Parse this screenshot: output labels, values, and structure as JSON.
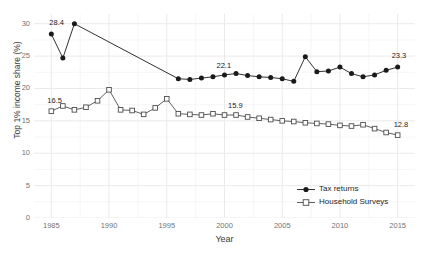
{
  "chart_data": {
    "type": "line",
    "title": "",
    "xlabel": "Year",
    "ylabel": "Top 1% income share (%)",
    "xlim": [
      1983.5,
      2016.5
    ],
    "ylim": [
      0,
      31.5
    ],
    "grid": true,
    "legend_position": "bottom-right",
    "y_ticks": [
      0,
      5,
      10,
      15,
      20,
      25,
      30
    ],
    "x_ticks": [
      1985,
      1990,
      1995,
      2000,
      2005,
      2010,
      2015
    ],
    "series": [
      {
        "name": "Tax returns",
        "marker": "filled-circle",
        "color": "#1a1a1a",
        "x": [
          1985,
          1986,
          1987,
          1996,
          1997,
          1998,
          1999,
          2000,
          2001,
          2002,
          2003,
          2004,
          2005,
          2006,
          2007,
          2008,
          2009,
          2010,
          2011,
          2012,
          2013,
          2014,
          2015
        ],
        "values": [
          28.4,
          24.7,
          30.0,
          21.5,
          21.4,
          21.6,
          21.8,
          22.1,
          22.3,
          22.0,
          21.8,
          21.7,
          21.5,
          21.1,
          24.9,
          22.6,
          22.7,
          23.3,
          22.3,
          21.8,
          22.1,
          22.8,
          23.3
        ]
      },
      {
        "name": "Household Surveys",
        "marker": "open-square",
        "color": "#4d4d4d",
        "x": [
          1985,
          1986,
          1987,
          1988,
          1989,
          1990,
          1991,
          1992,
          1993,
          1994,
          1995,
          1996,
          1997,
          1998,
          1999,
          2000,
          2001,
          2002,
          2003,
          2004,
          2005,
          2006,
          2007,
          2008,
          2009,
          2010,
          2011,
          2012,
          2013,
          2014,
          2015
        ],
        "values": [
          16.5,
          17.3,
          16.7,
          17.1,
          18.1,
          19.8,
          16.7,
          16.6,
          16.0,
          17.0,
          18.4,
          16.1,
          16.0,
          15.9,
          16.1,
          15.9,
          15.9,
          15.6,
          15.4,
          15.2,
          15.0,
          14.9,
          14.7,
          14.6,
          14.5,
          14.3,
          14.2,
          14.4,
          13.8,
          13.2,
          12.8
        ]
      }
    ],
    "annotations": [
      {
        "text": "28.4",
        "series": "Tax returns",
        "x": 1985,
        "value": 28.4
      },
      {
        "text": "22.1",
        "series": "Tax returns",
        "x": 2000,
        "value": 22.1
      },
      {
        "text": "23.3",
        "series": "Tax returns",
        "x": 2015,
        "value": 23.3
      },
      {
        "text": "16.5",
        "series": "Household Surveys",
        "x": 1985,
        "value": 16.5
      },
      {
        "text": "15.9",
        "series": "Household Surveys",
        "x": 2001,
        "value": 15.9
      },
      {
        "text": "12.8",
        "series": "Household Surveys",
        "x": 2015,
        "value": 12.8
      }
    ]
  },
  "legend": {
    "items": [
      {
        "label": "Tax returns"
      },
      {
        "label": "Household Surveys"
      }
    ]
  },
  "colors": {
    "background": "#ffffff",
    "gridline_major": "#eaeaea",
    "gridline_minor": "#f4f4f4",
    "tax_returns": "#1a1a1a",
    "household_surveys": "#4d4d4d",
    "tick_text": "#737373",
    "axis_title": "#3d3d3d"
  }
}
